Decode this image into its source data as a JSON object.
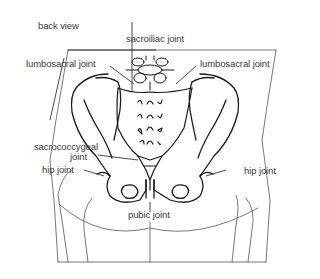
{
  "diagram": {
    "view_label": "back view",
    "labels": {
      "sacroiliac": "sacroiliac joint",
      "lumbosacral_left": "lumbosacral joint",
      "lumbosacral_right": "lumbosacral joint",
      "sacrococcygeal_line1": "sacrococcygeal",
      "sacrococcygeal_line2": "joint",
      "hip_left": "hip joint",
      "hip_right": "hip joint",
      "pubic": "pubic joint"
    },
    "colors": {
      "line": "#1a1a1a",
      "text": "#3a3a3a",
      "background": "#ffffff"
    }
  }
}
